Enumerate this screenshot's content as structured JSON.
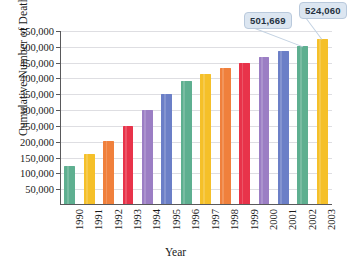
{
  "chart_data": {
    "type": "bar",
    "title": "",
    "xlabel": "Year",
    "ylabel": "Cumulative Number of Deaths",
    "categories": [
      "1990",
      "1991",
      "1992",
      "1993",
      "1994",
      "1995",
      "1996",
      "1997",
      "1998",
      "1999",
      "2000",
      "2001",
      "2002",
      "2003"
    ],
    "values": [
      122000,
      160000,
      202000,
      250000,
      300000,
      352000,
      391000,
      413000,
      432000,
      450000,
      467000,
      486000,
      501669,
      524060
    ],
    "ylim": [
      0,
      550000
    ],
    "ytick_labels": [
      "50,000",
      "100,000",
      "150,000",
      "200,000",
      "250,000",
      "300,000",
      "350,000",
      "400,000",
      "450,000",
      "500,000",
      "550,000"
    ],
    "ytick_values": [
      50000,
      100000,
      150000,
      200000,
      250000,
      300000,
      350000,
      400000,
      450000,
      500000,
      550000
    ],
    "grid": true,
    "legend": "none",
    "bar_colors": [
      "#5eaf90",
      "#f5c029",
      "#f0803c",
      "#e8334a",
      "#9b7ec4",
      "#6b7fc7",
      "#5eaf90",
      "#f5c029",
      "#f0803c",
      "#e8334a",
      "#9b7ec4",
      "#6b7fc7",
      "#5eaf90",
      "#f5c029"
    ],
    "annotations": [
      {
        "category": "2002",
        "label": "501,669",
        "value": 501669
      },
      {
        "category": "2003",
        "label": "524,060",
        "value": 524060
      }
    ]
  },
  "colors": {
    "green": "#5eaf90",
    "gold": "#f5c029",
    "orange": "#f0803c",
    "red": "#e8334a",
    "purple": "#9b7ec4",
    "blue": "#6b7fc7",
    "axis": "#59595b",
    "grid": "#dedee2",
    "callout_fill": "#dce6f1",
    "callout_border": "#b9c9dc"
  }
}
